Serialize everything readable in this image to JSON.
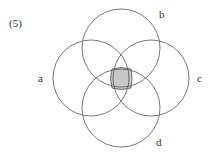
{
  "figure_number": "(5)",
  "sets": [
    {
      "label": "a",
      "cx": 91,
      "cy": 78,
      "r": 38
    },
    {
      "label": "b",
      "cx": 121,
      "cy": 48,
      "r": 39
    },
    {
      "label": "c",
      "cx": 151,
      "cy": 78,
      "r": 38
    },
    {
      "label": "d",
      "cx": 121,
      "cy": 108,
      "r": 39
    }
  ],
  "shaded_region": "a ∩ b ∩ c ∩ d",
  "colors": {
    "stroke": "#555555",
    "shade": "#c8c8c8"
  }
}
